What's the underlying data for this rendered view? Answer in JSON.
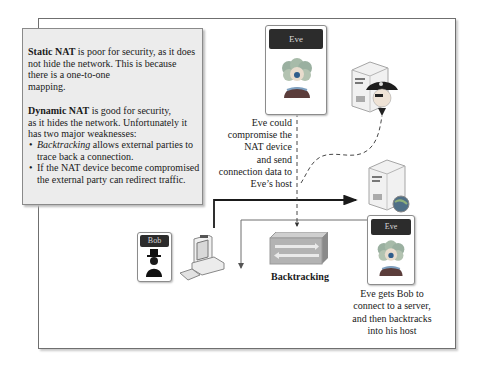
{
  "note": {
    "static_nat_term": "Static NAT",
    "static_nat_lines": [
      " is poor for security, as it does",
      "not hide the network. This is because",
      "there is a one-to-one",
      "mapping."
    ],
    "dynamic_nat_term": "Dynamic NAT",
    "dynamic_nat_lines": [
      " is good for security,",
      "as it hides the network. Unfortunately it",
      "has two major weaknesses:"
    ],
    "bullets": [
      {
        "emphasis": "Backtracking",
        "text": " allows external parties to",
        "text2": "trace back a connection."
      },
      {
        "emphasis": "",
        "text": "If the NAT device become compromised",
        "text2": "the external party can redirect traffic."
      }
    ],
    "bullet_glyph": "•"
  },
  "actors": {
    "eve_top": {
      "name": "Eve",
      "icon": "eve-avatar-icon"
    },
    "eve_bottom": {
      "name": "Eve",
      "icon": "eve-avatar-icon"
    },
    "bob": {
      "name": "Bob",
      "icon": "bob-avatar-icon"
    }
  },
  "devices": {
    "pirate_server": "pirate-server-icon",
    "server": "server-globe-icon",
    "bob_computer": "desktop-computer-icon",
    "nat_device": "nat-router-icon"
  },
  "annotations": {
    "eve_compromise": [
      "Eve could",
      "compromise the",
      "NAT device",
      "and send",
      "connection data to",
      "Eve’s host"
    ],
    "backtracking_label": "Backtracking",
    "eve_backtrack": [
      "Eve gets Bob to",
      "connect to a server,",
      "and then backtracks",
      "into his host"
    ]
  },
  "colors": {
    "card_header": "#2c2c2c",
    "note_bg": "#ececec",
    "connection_line": "#1a1a1a",
    "return_line": "#6e6e6e",
    "nat_device": "#b3b3b3"
  }
}
